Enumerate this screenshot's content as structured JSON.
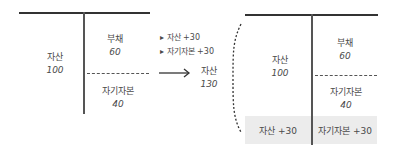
{
  "left_account": {
    "assets": {
      "label": "자산",
      "value": "100"
    },
    "liabilities": {
      "label": "부채",
      "value": "60"
    },
    "equity": {
      "label": "자기자본",
      "value": "40"
    }
  },
  "changes": {
    "items": [
      "▸ 자산 +30",
      "▸ 자기자본 +30"
    ]
  },
  "total_assets": {
    "label": "자산",
    "value": "130"
  },
  "right_account": {
    "assets": {
      "label": "자산",
      "value": "100"
    },
    "liabilities": {
      "label": "부채",
      "value": "60"
    },
    "equity": {
      "label": "자기자본",
      "value": "40"
    },
    "added_assets": "자산 +30",
    "added_equity": "자기자본 +30"
  },
  "colors": {
    "line": "#333333",
    "shade": "#ececec",
    "text": "#4a4a4a"
  }
}
